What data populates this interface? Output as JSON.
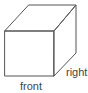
{
  "figure": {
    "type": "isometric-cube-line-drawing",
    "background_color": "#ffffff",
    "line_color": "#555555",
    "label_color": "#444444",
    "labels": {
      "front": "front",
      "right": "right"
    },
    "chart_data": {
      "type": "diagram",
      "title": "",
      "description": "Oblique projection line drawing of a cube; front face square facing viewer, top and right faces receding up-right; bottom-front face labeled front, lower-right receding face labeled right",
      "faces": {
        "top_face_points": "29,5 76,5 54,31 5,31",
        "front_face_points": "5,31 54,31 54,76 5,76",
        "right_face_points": "54,31 76,5 76,53 54,76"
      }
    }
  }
}
